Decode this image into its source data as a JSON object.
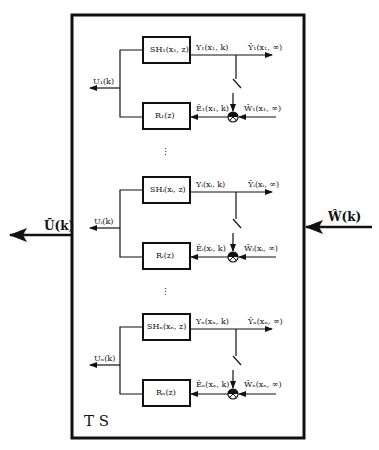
{
  "diagram": {
    "system_label": "T S",
    "output_label": "Ū(k)",
    "input_label": "Ŵ(k)",
    "loops": [
      {
        "plant": "SH₁(x₁, z)",
        "controller": "R₁(z)",
        "output": "Y₁(x₁, k)",
        "output_ss": "Ŷ₁(x₁, ∞)",
        "error": "Ē₁(x₁, k)",
        "reference": "Ŵ₁(x₁, ∞)",
        "control": "U₁(k)"
      },
      {
        "plant": "SHᵢ(xᵢ, z)",
        "controller": "Rᵢ(z)",
        "output": "Yᵢ(xᵢ, k)",
        "output_ss": "Ŷᵢ(xᵢ, ∞)",
        "error": "Ēᵢ(xᵢ, k)",
        "reference": "Ŵᵢ(xᵢ, ∞)",
        "control": "Uᵢ(k)"
      },
      {
        "plant": "SHₙ(xₙ, z)",
        "controller": "Rₙ(z)",
        "output": "Yₙ(xₙ, k)",
        "output_ss": "Ŷₙ(xₙ, ∞)",
        "error": "Ēₙ(xₙ, k)",
        "reference": "Ŵₙ(xₙ, ∞)",
        "control": "Uₙ(k)"
      }
    ],
    "ellipsis": "⋮",
    "colors": {
      "line": "#111111",
      "background": "#ffffff"
    }
  }
}
